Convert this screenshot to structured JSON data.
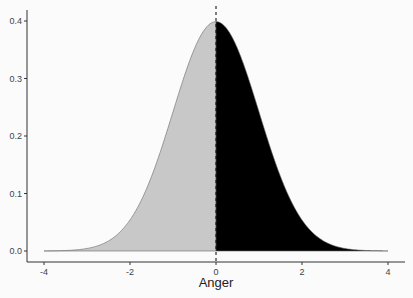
{
  "chart_data": {
    "type": "area",
    "title": "",
    "xlabel": "Anger",
    "ylabel": "",
    "xlim": [
      -4,
      4
    ],
    "ylim": [
      0,
      0.4
    ],
    "x_ticks": [
      "-4",
      "-2",
      "0",
      "2",
      "4"
    ],
    "y_ticks": [
      "0.0",
      "0.1",
      "0.2",
      "0.3",
      "0.4"
    ],
    "grid": false,
    "legend": null,
    "series": [
      {
        "name": "standard normal density (x < 0)",
        "fill": "#c8c8c8",
        "x": [
          -4,
          -3,
          -2,
          -1,
          0
        ],
        "values": [
          0.0001,
          0.0044,
          0.054,
          0.242,
          0.3989
        ]
      },
      {
        "name": "standard normal density (x >= 0)",
        "fill": "#000000",
        "x": [
          0,
          1,
          2,
          3,
          4
        ],
        "values": [
          0.3989,
          0.242,
          0.054,
          0.0044,
          0.0001
        ]
      }
    ],
    "annotations": [
      {
        "type": "vline",
        "x": 0,
        "style": "dashed"
      }
    ]
  }
}
